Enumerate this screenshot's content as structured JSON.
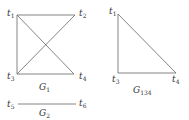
{
  "graphs": [
    {
      "name": "G",
      "subscript": "1",
      "nodes": [
        {
          "id": "t1",
          "base": "t",
          "sub": "1",
          "x": 17,
          "y": 15
        },
        {
          "id": "t2",
          "base": "t",
          "sub": "2",
          "x": 75,
          "y": 15
        },
        {
          "id": "t3",
          "base": "t",
          "sub": "3",
          "x": 17,
          "y": 76
        },
        {
          "id": "t4",
          "base": "t",
          "sub": "4",
          "x": 74,
          "y": 76
        }
      ],
      "edges": [
        [
          "t1",
          "t2"
        ],
        [
          "t1",
          "t3"
        ],
        [
          "t1",
          "t4"
        ],
        [
          "t2",
          "t3"
        ],
        [
          "t3",
          "t4"
        ]
      ]
    },
    {
      "name": "G",
      "subscript": "2",
      "nodes": [
        {
          "id": "t5",
          "base": "t",
          "sub": "5"
        },
        {
          "id": "t6",
          "base": "t",
          "sub": "6"
        }
      ],
      "edges": [
        [
          "t5",
          "t6"
        ]
      ]
    },
    {
      "name": "G",
      "subscript": "134",
      "nodes": [
        {
          "id": "t1",
          "base": "t",
          "sub": "1"
        },
        {
          "id": "t3",
          "base": "t",
          "sub": "3"
        },
        {
          "id": "t4",
          "base": "t",
          "sub": "4"
        }
      ],
      "edges": [
        [
          "t1",
          "t3"
        ],
        [
          "t1",
          "t4"
        ],
        [
          "t3",
          "t4"
        ]
      ]
    }
  ],
  "labels": {
    "g1_t1": "t",
    "g1_t1_sub": "1",
    "g1_t2": "t",
    "g1_t2_sub": "2",
    "g1_t3": "t",
    "g1_t3_sub": "3",
    "g1_t4": "t",
    "g1_t4_sub": "4",
    "g1_name": "G",
    "g1_sub": "1",
    "g2_t5": "t",
    "g2_t5_sub": "5",
    "g2_t6": "t",
    "g2_t6_sub": "6",
    "g2_name": "G",
    "g2_sub": "2",
    "g134_t1": "t",
    "g134_t1_sub": "1",
    "g134_t3": "t",
    "g134_t3_sub": "3",
    "g134_t4": "t",
    "g134_t4_sub": "4",
    "g134_name": "G",
    "g134_sub": "134"
  }
}
